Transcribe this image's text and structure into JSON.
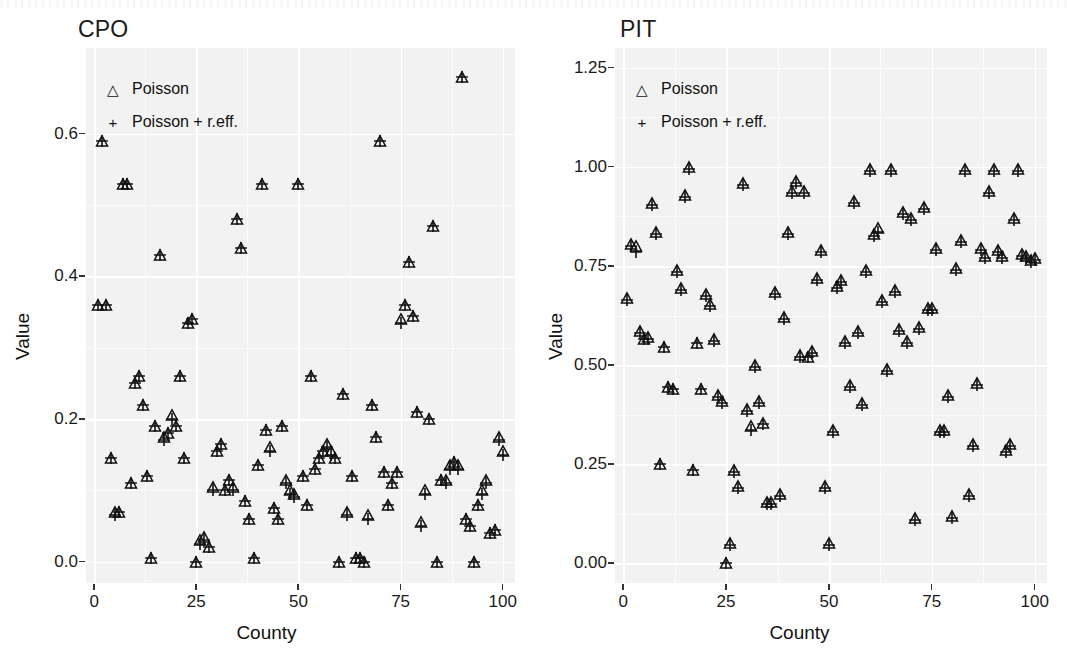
{
  "figure": {
    "panels": [
      {
        "id": "cpo",
        "title": "CPO",
        "xlabel": "County",
        "ylabel": "Value",
        "xticks": [
          "0",
          "25",
          "50",
          "75",
          "100"
        ],
        "yticks": [
          "0.0",
          "0.2",
          "0.4",
          "0.6"
        ]
      },
      {
        "id": "pit",
        "title": "PIT",
        "xlabel": "County",
        "ylabel": "Value",
        "xticks": [
          "0",
          "25",
          "50",
          "75",
          "100"
        ],
        "yticks": [
          "0.00",
          "0.25",
          "0.50",
          "0.75",
          "1.00",
          "1.25"
        ]
      }
    ],
    "legend": {
      "entries": [
        {
          "key": "triangle-open-marker",
          "glyph": "△",
          "label": "Poisson"
        },
        {
          "key": "plus-marker",
          "glyph": "+",
          "label": "Poisson + r.eff."
        }
      ]
    },
    "colors": {
      "panel_background": "#f2f2f2",
      "gridline": "#ffffff",
      "marker": "#111111",
      "text": "#1a1a1a",
      "page_background": "#ffffff"
    }
  },
  "chart_data": [
    {
      "type": "scatter",
      "id": "cpo",
      "title": "CPO",
      "xlabel": "County",
      "ylabel": "Value",
      "xlim": [
        -2,
        103
      ],
      "ylim": [
        -0.03,
        0.72
      ],
      "xticks": [
        0,
        25,
        50,
        75,
        100
      ],
      "yticks": [
        0.0,
        0.2,
        0.4,
        0.6
      ],
      "grid": true,
      "legend_position": "inside-top-left",
      "series": [
        {
          "name": "Poisson",
          "marker": "triangle-open",
          "x": [
            1,
            2,
            3,
            4,
            5,
            6,
            7,
            8,
            9,
            10,
            11,
            12,
            13,
            14,
            15,
            16,
            17,
            18,
            19,
            20,
            21,
            22,
            23,
            24,
            25,
            26,
            27,
            28,
            29,
            30,
            31,
            32,
            33,
            34,
            35,
            36,
            37,
            38,
            39,
            40,
            41,
            42,
            43,
            44,
            45,
            46,
            47,
            48,
            49,
            50,
            51,
            52,
            53,
            54,
            55,
            56,
            57,
            58,
            59,
            60,
            61,
            62,
            63,
            64,
            65,
            66,
            67,
            68,
            69,
            70,
            71,
            72,
            73,
            74,
            75,
            76,
            77,
            78,
            79,
            80,
            81,
            82,
            83,
            84,
            85,
            86,
            87,
            88,
            89,
            90,
            91,
            92,
            93,
            94,
            95,
            96,
            97,
            98,
            99,
            100
          ],
          "y": [
            0.36,
            0.59,
            0.36,
            0.145,
            0.07,
            0.07,
            0.53,
            0.53,
            0.11,
            0.25,
            0.26,
            0.22,
            0.12,
            0.005,
            0.19,
            0.43,
            0.175,
            0.18,
            0.205,
            0.19,
            0.26,
            0.145,
            0.335,
            0.34,
            0.0,
            0.03,
            0.035,
            0.02,
            0.105,
            0.155,
            0.165,
            0.1,
            0.115,
            0.105,
            0.48,
            0.44,
            0.085,
            0.06,
            0.005,
            0.135,
            0.53,
            0.185,
            0.16,
            0.075,
            0.06,
            0.19,
            0.115,
            0.1,
            0.095,
            0.53,
            0.12,
            0.08,
            0.26,
            0.13,
            0.145,
            0.155,
            0.165,
            0.155,
            0.145,
            0.0,
            0.235,
            0.07,
            0.12,
            0.005,
            0.005,
            0.0,
            0.065,
            0.22,
            0.175,
            0.59,
            0.125,
            0.08,
            0.11,
            0.125,
            0.34,
            0.36,
            0.42,
            0.345,
            0.21,
            0.055,
            0.1,
            0.2,
            0.47,
            0.0,
            0.115,
            0.115,
            0.135,
            0.14,
            0.135,
            0.68,
            0.06,
            0.05,
            0.0,
            0.08,
            0.1,
            0.115,
            0.04,
            0.045,
            0.175,
            0.155
          ]
        },
        {
          "name": "Poisson + r.eff.",
          "marker": "plus",
          "x": [
            1,
            2,
            3,
            4,
            5,
            6,
            7,
            8,
            9,
            10,
            11,
            12,
            13,
            14,
            15,
            16,
            17,
            18,
            19,
            20,
            21,
            22,
            23,
            24,
            25,
            26,
            27,
            28,
            29,
            30,
            31,
            32,
            33,
            34,
            35,
            36,
            37,
            38,
            39,
            40,
            41,
            42,
            43,
            44,
            45,
            46,
            47,
            48,
            49,
            50,
            51,
            52,
            53,
            54,
            55,
            56,
            57,
            58,
            59,
            60,
            61,
            62,
            63,
            64,
            65,
            66,
            67,
            68,
            69,
            70,
            71,
            72,
            73,
            74,
            75,
            76,
            77,
            78,
            79,
            80,
            81,
            82,
            83,
            84,
            85,
            86,
            87,
            88,
            89,
            90,
            91,
            92,
            93,
            94,
            95,
            96,
            97,
            98,
            99,
            100
          ],
          "y": [
            0.36,
            0.59,
            0.36,
            0.145,
            0.065,
            0.07,
            0.53,
            0.53,
            0.11,
            0.25,
            0.26,
            0.22,
            0.12,
            0.005,
            0.19,
            0.43,
            0.17,
            0.18,
            0.2,
            0.19,
            0.26,
            0.145,
            0.335,
            0.34,
            0.0,
            0.025,
            0.03,
            0.02,
            0.1,
            0.155,
            0.165,
            0.1,
            0.115,
            0.1,
            0.48,
            0.44,
            0.085,
            0.06,
            0.005,
            0.135,
            0.53,
            0.185,
            0.155,
            0.075,
            0.06,
            0.19,
            0.11,
            0.095,
            0.09,
            0.53,
            0.12,
            0.08,
            0.26,
            0.13,
            0.145,
            0.155,
            0.16,
            0.15,
            0.145,
            0.0,
            0.235,
            0.065,
            0.12,
            0.005,
            0.005,
            0.0,
            0.06,
            0.22,
            0.175,
            0.59,
            0.125,
            0.08,
            0.11,
            0.125,
            0.335,
            0.36,
            0.42,
            0.345,
            0.21,
            0.05,
            0.095,
            0.2,
            0.47,
            0.0,
            0.115,
            0.11,
            0.13,
            0.14,
            0.13,
            0.68,
            0.06,
            0.05,
            0.0,
            0.08,
            0.095,
            0.11,
            0.04,
            0.045,
            0.17,
            0.15
          ]
        }
      ]
    },
    {
      "type": "scatter",
      "id": "pit",
      "title": "PIT",
      "xlabel": "County",
      "ylabel": "Value",
      "xlim": [
        -2,
        103
      ],
      "ylim": [
        -0.05,
        1.3
      ],
      "xticks": [
        0,
        25,
        50,
        75,
        100
      ],
      "yticks": [
        0.0,
        0.25,
        0.5,
        0.75,
        1.0,
        1.25
      ],
      "grid": true,
      "legend_position": "inside-top-left",
      "series": [
        {
          "name": "Poisson",
          "marker": "triangle-open",
          "x": [
            1,
            2,
            3,
            4,
            5,
            6,
            7,
            8,
            9,
            10,
            11,
            12,
            13,
            14,
            15,
            16,
            17,
            18,
            19,
            20,
            21,
            22,
            23,
            24,
            25,
            26,
            27,
            28,
            29,
            30,
            31,
            32,
            33,
            34,
            35,
            36,
            37,
            38,
            39,
            40,
            41,
            42,
            43,
            44,
            45,
            46,
            47,
            48,
            49,
            50,
            51,
            52,
            53,
            54,
            55,
            56,
            57,
            58,
            59,
            60,
            61,
            62,
            63,
            64,
            65,
            66,
            67,
            68,
            69,
            70,
            71,
            72,
            73,
            74,
            75,
            76,
            77,
            78,
            79,
            80,
            81,
            82,
            83,
            84,
            85,
            86,
            87,
            88,
            89,
            90,
            91,
            92,
            93,
            94,
            95,
            96,
            97,
            98,
            99,
            100
          ],
          "y": [
            0.67,
            0.805,
            0.8,
            0.585,
            0.565,
            0.57,
            0.91,
            0.835,
            0.25,
            0.545,
            0.445,
            0.44,
            0.74,
            0.695,
            0.93,
            1.0,
            0.235,
            0.555,
            0.44,
            0.68,
            0.655,
            0.565,
            0.425,
            0.41,
            0.0,
            0.05,
            0.235,
            0.195,
            0.96,
            0.39,
            0.345,
            0.5,
            0.41,
            0.355,
            0.155,
            0.155,
            0.685,
            0.175,
            0.62,
            0.835,
            0.94,
            0.965,
            0.525,
            0.94,
            0.52,
            0.535,
            0.72,
            0.79,
            0.195,
            0.05,
            0.335,
            0.7,
            0.715,
            0.56,
            0.45,
            0.915,
            0.585,
            0.405,
            0.74,
            0.995,
            0.83,
            0.845,
            0.665,
            0.49,
            0.995,
            0.69,
            0.59,
            0.885,
            0.56,
            0.87,
            0.115,
            0.595,
            0.9,
            0.645,
            0.645,
            0.795,
            0.335,
            0.335,
            0.425,
            0.12,
            0.745,
            0.815,
            0.995,
            0.175,
            0.3,
            0.455,
            0.795,
            0.775,
            0.94,
            0.995,
            0.79,
            0.775,
            0.285,
            0.3,
            0.87,
            0.995,
            0.78,
            0.775,
            0.765,
            0.77
          ]
        },
        {
          "name": "Poisson + r.eff.",
          "marker": "plus",
          "x": [
            1,
            2,
            3,
            4,
            5,
            6,
            7,
            8,
            9,
            10,
            11,
            12,
            13,
            14,
            15,
            16,
            17,
            18,
            19,
            20,
            21,
            22,
            23,
            24,
            25,
            26,
            27,
            28,
            29,
            30,
            31,
            32,
            33,
            34,
            35,
            36,
            37,
            38,
            39,
            40,
            41,
            42,
            43,
            44,
            45,
            46,
            47,
            48,
            49,
            50,
            51,
            52,
            53,
            54,
            55,
            56,
            57,
            58,
            59,
            60,
            61,
            62,
            63,
            64,
            65,
            66,
            67,
            68,
            69,
            70,
            71,
            72,
            73,
            74,
            75,
            76,
            77,
            78,
            79,
            80,
            81,
            82,
            83,
            84,
            85,
            86,
            87,
            88,
            89,
            90,
            91,
            92,
            93,
            94,
            95,
            96,
            97,
            98,
            99,
            100
          ],
          "y": [
            0.665,
            0.8,
            0.785,
            0.58,
            0.565,
            0.565,
            0.905,
            0.83,
            0.25,
            0.545,
            0.445,
            0.44,
            0.735,
            0.69,
            0.925,
            0.995,
            0.235,
            0.555,
            0.44,
            0.675,
            0.65,
            0.56,
            0.42,
            0.405,
            0.0,
            0.045,
            0.23,
            0.19,
            0.955,
            0.385,
            0.335,
            0.495,
            0.405,
            0.35,
            0.15,
            0.15,
            0.68,
            0.17,
            0.615,
            0.83,
            0.935,
            0.96,
            0.52,
            0.935,
            0.52,
            0.53,
            0.715,
            0.785,
            0.19,
            0.045,
            0.33,
            0.695,
            0.71,
            0.555,
            0.445,
            0.91,
            0.58,
            0.4,
            0.735,
            0.99,
            0.825,
            0.835,
            0.66,
            0.485,
            0.99,
            0.685,
            0.585,
            0.88,
            0.555,
            0.865,
            0.11,
            0.59,
            0.895,
            0.64,
            0.64,
            0.79,
            0.33,
            0.33,
            0.42,
            0.115,
            0.74,
            0.81,
            0.99,
            0.17,
            0.295,
            0.45,
            0.79,
            0.77,
            0.935,
            0.99,
            0.785,
            0.77,
            0.28,
            0.295,
            0.865,
            0.99,
            0.775,
            0.77,
            0.76,
            0.765
          ]
        }
      ]
    }
  ]
}
